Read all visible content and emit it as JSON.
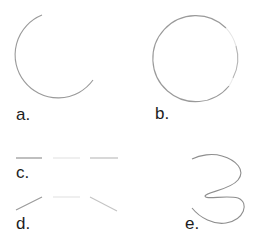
{
  "figure": {
    "panels": [
      {
        "id": "a",
        "label": "a.",
        "shape": "open-arc",
        "description": "circular arc, gap on upper right"
      },
      {
        "id": "b",
        "label": "b.",
        "shape": "circle-with-fading-gaps",
        "description": "nearly complete circle with faint/missing segments on right"
      },
      {
        "id": "c",
        "label": "c.",
        "shape": "dashed-horizontal-line",
        "description": "three collinear segments with varying intensity"
      },
      {
        "id": "d",
        "label": "d.",
        "shape": "bent-line-segments",
        "description": "three segments: rising, horizontal faint, falling"
      },
      {
        "id": "e",
        "label": "e.",
        "shape": "squiggle-curve",
        "description": "smooth S/3-shaped curve"
      }
    ],
    "stroke_color": "#8a8a8a",
    "faint_stroke_color": "#d8d8d8",
    "label_color": "#1e1e1e"
  }
}
